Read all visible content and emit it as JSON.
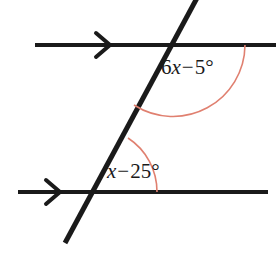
{
  "figure": {
    "type": "geometry-diagram",
    "background_color": "#ffffff",
    "line_color": "#1a1a1a",
    "arc_color": "#e08070",
    "text_color": "#1a1a1a",
    "lines": [
      {
        "name": "upper-parallel-line",
        "x1": 35,
        "y1": 45,
        "x2": 276,
        "y2": 45,
        "marker": "single-chevron-arrow",
        "marker_x": 105
      },
      {
        "name": "lower-parallel-line",
        "x1": 18,
        "y1": 192,
        "x2": 268,
        "y2": 192,
        "marker": "single-chevron-arrow",
        "marker_x": 56
      },
      {
        "name": "transversal-line",
        "x1": 196,
        "y1": 0,
        "x2": 66,
        "y2": 241,
        "marker": "none"
      }
    ],
    "intersections": [
      {
        "name": "upper-intersection",
        "x": 173,
        "y": 45
      },
      {
        "name": "lower-intersection",
        "x": 93,
        "y": 192
      }
    ],
    "angles": [
      {
        "name": "upper-angle",
        "label_parts": {
          "coefficient": "6",
          "variable": "x",
          "operator": "−",
          "constant": "5",
          "degree": "°"
        },
        "label_text": "6x − 5°",
        "vertex": {
          "x": 173,
          "y": 45
        },
        "arc_radius": 72,
        "arc_color": "#e08070",
        "position": "below-right of upper intersection"
      },
      {
        "name": "lower-angle",
        "label_parts": {
          "coefficient": "",
          "variable": "x",
          "operator": "−",
          "constant": "25",
          "degree": "°"
        },
        "label_text": "x − 25°",
        "vertex": {
          "x": 93,
          "y": 192
        },
        "arc_radius": 64,
        "arc_color": "#e08070",
        "position": "above-right of lower intersection"
      }
    ]
  }
}
